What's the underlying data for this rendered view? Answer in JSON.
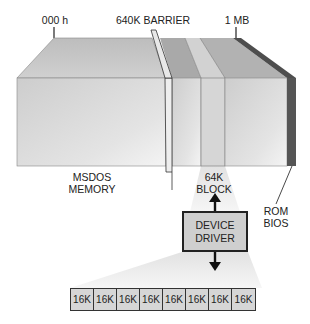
{
  "diagram": {
    "top_labels": {
      "start": "000 h",
      "barrier": "640K BARRIER",
      "end": "1 MB"
    },
    "region_labels": {
      "msdos_line1": "MSDOS",
      "msdos_line2": "MEMORY",
      "block_line1": "64K",
      "block_line2": "BLOCK",
      "rom_line1": "ROM",
      "rom_line2": "BIOS"
    },
    "device_driver": {
      "line1": "DEVICE",
      "line2": "DRIVER"
    },
    "pages": [
      "16K",
      "16K",
      "16K",
      "16K",
      "16K",
      "16K",
      "16K",
      "16K"
    ],
    "colors": {
      "block_face": "#d8d8d8",
      "block_top": "#c4c4c4",
      "rom_strip": "#555555",
      "driver_box": "#cfcfcf",
      "funnel": "#ececec",
      "outline": "#222222"
    }
  }
}
